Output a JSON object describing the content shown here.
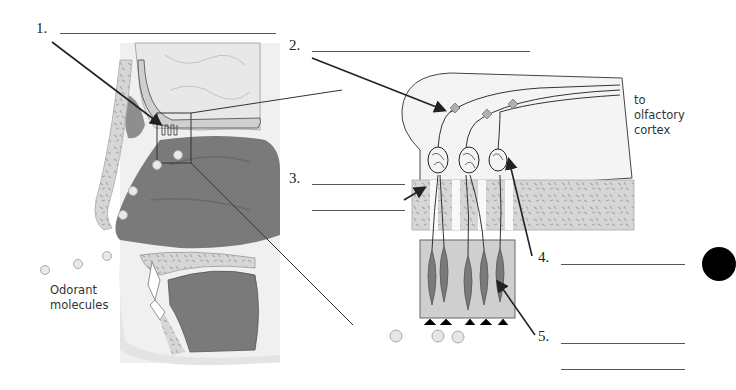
{
  "diagram": {
    "labels": [
      {
        "id": "1",
        "text": "1.",
        "answer": ""
      },
      {
        "id": "2",
        "text": "2.",
        "answer": ""
      },
      {
        "id": "3",
        "text": "3.",
        "answer": ""
      },
      {
        "id": "4",
        "text": "4.",
        "answer": ""
      },
      {
        "id": "5",
        "text": "5.",
        "answer": ""
      }
    ],
    "annotations": {
      "odorant": "Odorant molecules",
      "odorant_line1": "Odorant",
      "odorant_line2": "molecules",
      "cortex_line1": "to",
      "cortex_line2": "olfactory",
      "cortex_line3": "cortex"
    },
    "colors": {
      "dark_tissue": "#7a7a7a",
      "light_tissue": "#e6e6e6",
      "bone": "#d2d2d2",
      "brain": "#ececec",
      "line": "#222222"
    }
  }
}
